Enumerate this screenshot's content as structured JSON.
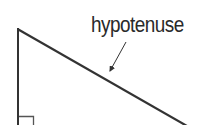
{
  "diagram": {
    "labels": {
      "hypotenuse": "hypotenuse"
    },
    "colors": {
      "stroke": "#333333",
      "text": "#2a2a2a",
      "background": "#ffffff"
    },
    "elements": [
      {
        "type": "line",
        "name": "vertical-leg",
        "from": [
          18,
          29
        ],
        "to": [
          18,
          125
        ]
      },
      {
        "type": "line",
        "name": "hypotenuse",
        "from": [
          18,
          29
        ],
        "to": [
          186,
          125
        ]
      },
      {
        "type": "right-angle-marker",
        "corner": "bottom-left",
        "size": 16
      },
      {
        "type": "arrow",
        "name": "hypotenuse-pointer",
        "from": [
          126,
          42
        ],
        "to": [
          109,
          72
        ]
      }
    ]
  }
}
